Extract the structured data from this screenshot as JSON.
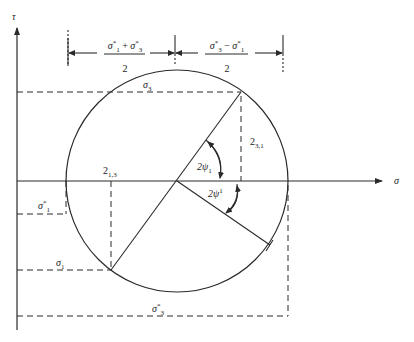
{
  "diagram": {
    "type": "mohr-circle",
    "colors": {
      "stroke": "#2a2a2a",
      "background": "#ffffff"
    },
    "axes": {
      "x_label": "σ",
      "y_label": "τ"
    },
    "dimensions": {
      "left": {
        "numerator": "σ*₁ + σ*₃",
        "num_a": "σ",
        "num_a_sup": "*",
        "num_a_sub": "1",
        "op": " + ",
        "num_b": "σ",
        "num_b_sup": "*",
        "num_b_sub": "3",
        "denominator": "2"
      },
      "right": {
        "numerator": "σ*₃ − σ*₁",
        "num_a": "σ",
        "num_a_sup": "*",
        "num_a_sub": "3",
        "op": " − ",
        "num_b": "σ",
        "num_b_sup": "*",
        "num_b_sub": "1",
        "denominator": "2"
      }
    },
    "labels": {
      "sigma3": {
        "main": "σ",
        "sub": "3"
      },
      "sigma1": {
        "main": "σ",
        "sub": "1"
      },
      "sigma1_star": {
        "main": "σ",
        "sup": "*",
        "sub": "1"
      },
      "sigma3_star": {
        "main": "σ",
        "sup": "*",
        "sub": "3"
      },
      "tau13": {
        "main": "2",
        "sub": "1,3"
      },
      "tau31": {
        "main": "2",
        "sub": "3,1"
      },
      "angle1": {
        "main": "2ψ",
        "sub": "1"
      },
      "angle2": {
        "main": "2ψ",
        "sup": "1"
      }
    },
    "geometry": {
      "center": [
        177,
        181
      ],
      "radius": 111,
      "point_upper": [
        241,
        92
      ],
      "point_lower_left": [
        111,
        270
      ],
      "point_lower_right": [
        270,
        245
      ]
    }
  }
}
